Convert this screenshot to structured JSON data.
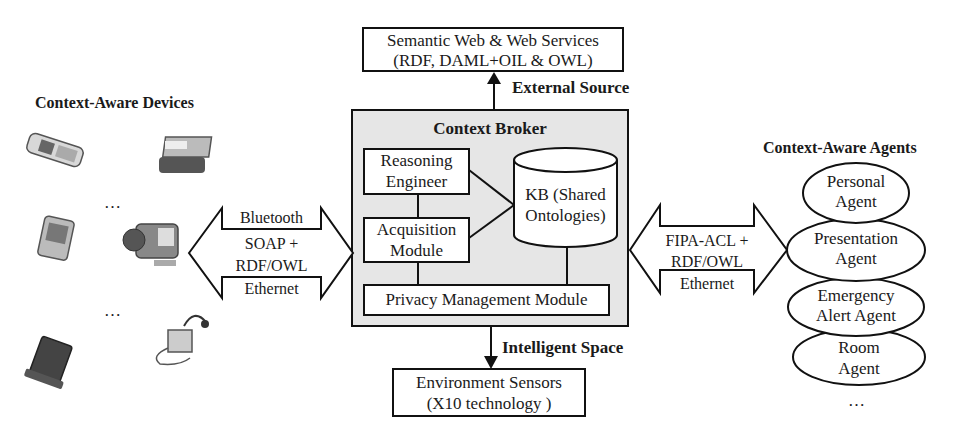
{
  "top_box": {
    "line1": "Semantic Web & Web Services",
    "line2": "(RDF, DAML+OIL & OWL)"
  },
  "external_source_label": "External Source",
  "context_broker": {
    "title": "Context Broker",
    "reasoning": {
      "line1": "Reasoning",
      "line2": "Engineer"
    },
    "acquisition": {
      "line1": "Acquisition",
      "line2": "Module"
    },
    "kb": {
      "line1": "KB (Shared",
      "line2": "Ontologies)"
    },
    "privacy": "Privacy Management Module",
    "fill_color": "#e6e6e6"
  },
  "intelligent_space_label": "Intelligent Space",
  "bottom_box": {
    "line1": "Environment Sensors",
    "line2": "(X10 technology )"
  },
  "devices": {
    "title": "Context-Aware Devices",
    "icons": [
      "mobile-phone-icon",
      "printer-icon",
      "pda-icon",
      "camcorder-icon",
      "tablet-icon",
      "music-player-icon"
    ],
    "ellipsis_1": "…",
    "ellipsis_2": "…"
  },
  "left_link": {
    "top": "Bluetooth",
    "mid1": "SOAP +",
    "mid2": "RDF/OWL",
    "bottom": "Ethernet"
  },
  "right_link": {
    "mid1": "FIPA-ACL +",
    "mid2": "RDF/OWL",
    "bottom": "Ethernet"
  },
  "agents": {
    "title": "Context-Aware Agents",
    "items": [
      {
        "line1": "Personal",
        "line2": "Agent"
      },
      {
        "line1": "Presentation",
        "line2": "Agent"
      },
      {
        "line1": "Emergency",
        "line2": "Alert Agent"
      },
      {
        "line1": "Room",
        "line2": "Agent"
      }
    ],
    "ellipsis": "…"
  }
}
